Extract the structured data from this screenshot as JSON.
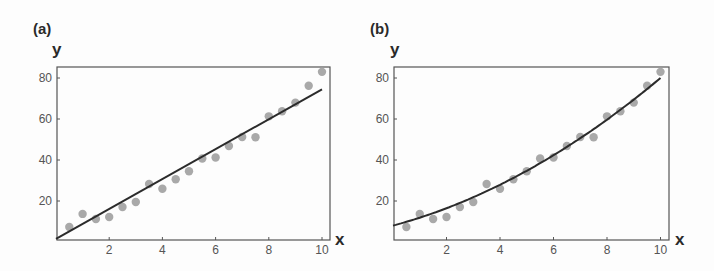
{
  "chart_data": [
    {
      "panel": "(a)",
      "type": "scatter",
      "fit": "linear",
      "xlabel": "x",
      "ylabel": "y",
      "xlim": [
        0,
        10.3
      ],
      "ylim": [
        0,
        85
      ],
      "xticks": [
        2,
        4,
        6,
        8,
        10
      ],
      "yticks": [
        20,
        40,
        60,
        80
      ],
      "grid": false,
      "x": [
        0.5,
        1,
        1.5,
        2,
        2.5,
        3,
        3.5,
        4,
        4.5,
        5,
        5.5,
        6,
        6.5,
        7,
        7.5,
        8,
        8.5,
        9,
        9.5,
        10
      ],
      "y": [
        7.3,
        13.7,
        11.2,
        12.2,
        17.1,
        19.5,
        28.3,
        26.0,
        30.6,
        34.5,
        40.7,
        41.2,
        46.8,
        51.2,
        51.1,
        61.3,
        63.8,
        68.0,
        76.2,
        83.0
      ],
      "fit_line": {
        "x": [
          0,
          10
        ],
        "y": [
          1.5,
          74.5
        ]
      }
    },
    {
      "panel": "(b)",
      "type": "scatter",
      "fit": "quadratic",
      "xlabel": "x",
      "ylabel": "y",
      "xlim": [
        0,
        10.3
      ],
      "ylim": [
        0,
        85
      ],
      "xticks": [
        2,
        4,
        6,
        8,
        10
      ],
      "yticks": [
        20,
        40,
        60,
        80
      ],
      "grid": false,
      "x": [
        0.5,
        1,
        1.5,
        2,
        2.5,
        3,
        3.5,
        4,
        4.5,
        5,
        5.5,
        6,
        6.5,
        7,
        7.5,
        8,
        8.5,
        9,
        9.5,
        10
      ],
      "y": [
        7.3,
        13.7,
        11.2,
        12.2,
        17.1,
        19.5,
        28.3,
        26.0,
        30.6,
        34.5,
        40.7,
        41.2,
        46.8,
        51.2,
        51.1,
        61.3,
        63.8,
        68.0,
        76.2,
        83.0
      ],
      "fit_curve": {
        "a": 8.0,
        "b": 3.5,
        "c": 0.37,
        "formula": "y = a + b*x + c*x^2"
      }
    }
  ],
  "panels": [
    {
      "label": "(a)",
      "x_axis": "x",
      "y_axis": "y"
    },
    {
      "label": "(b)",
      "x_axis": "x",
      "y_axis": "y"
    }
  ],
  "colors": {
    "points": "#a9a9a9",
    "line": "#2b2b2b",
    "frame": "#555555",
    "text": "#2a2a2a"
  }
}
